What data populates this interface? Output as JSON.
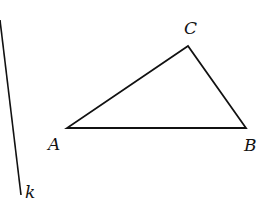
{
  "diagram": {
    "type": "geometry",
    "stroke_color": "#111111",
    "background": "#ffffff",
    "points": [
      {
        "name": "A",
        "label": "A",
        "x": 67,
        "y": 128
      },
      {
        "name": "B",
        "label": "B",
        "x": 246,
        "y": 128
      },
      {
        "name": "C",
        "label": "C",
        "x": 188,
        "y": 46
      }
    ],
    "segments": [
      {
        "from": "A",
        "to": "B"
      },
      {
        "from": "B",
        "to": "C"
      },
      {
        "from": "C",
        "to": "A"
      }
    ],
    "line_k": {
      "label": "k",
      "x1": 0,
      "y1": 20,
      "x2": 21,
      "y2": 195
    }
  }
}
